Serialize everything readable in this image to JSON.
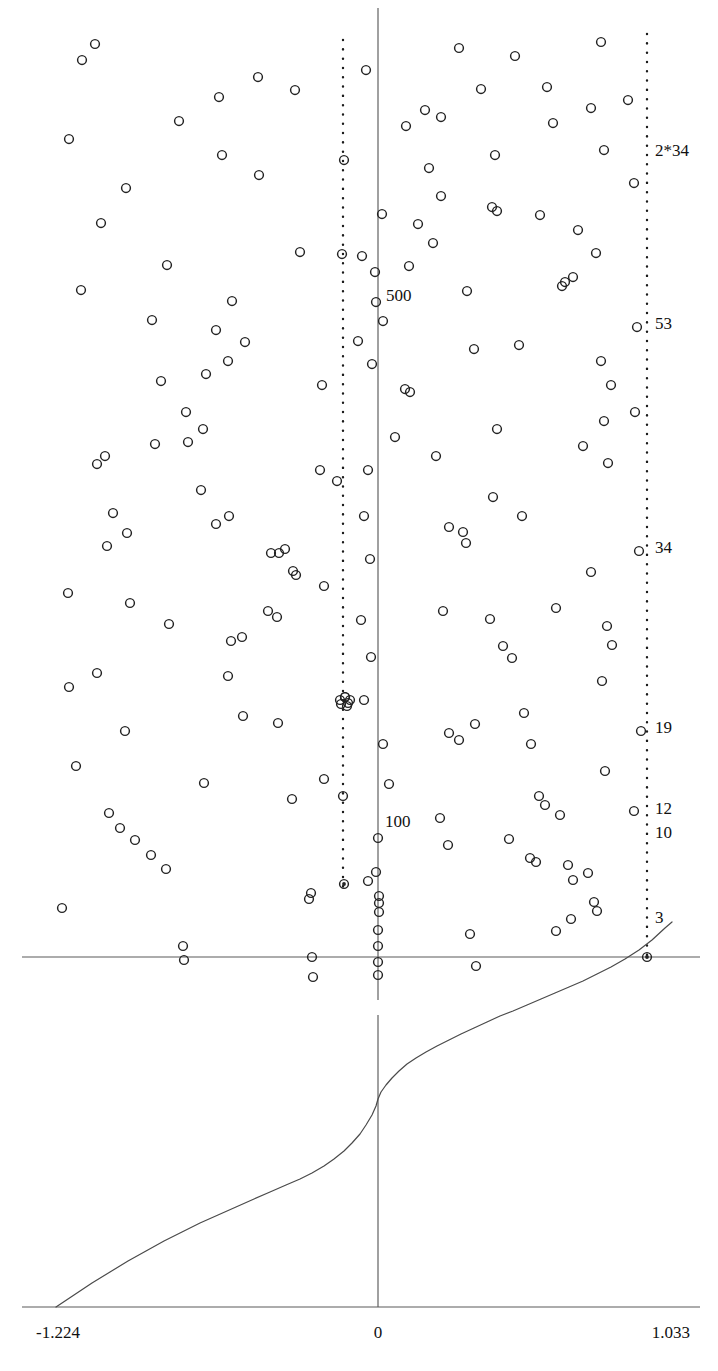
{
  "figure": {
    "title": "",
    "background": "#ffffff",
    "width": 718,
    "height": 1371
  },
  "colors": {
    "point_stroke": "#232323",
    "axis": "#5a5a5a",
    "reference_line": "#1b1b1b",
    "curve": "#4a4a4a",
    "text": "#111111"
  },
  "chart_data": {
    "type": "scatter",
    "title": "",
    "xlabel": "",
    "ylabel": "",
    "xlim": [
      -1.224,
      1.033
    ],
    "ylim": [
      0,
      1
    ],
    "grid": false,
    "legend": null,
    "panels": [
      {
        "name": "scatter-panel",
        "type": "scatter",
        "axis_x_zero_px": 378,
        "axis_y_baseline_px": 957,
        "marker": "open-circle",
        "marker_size_px": 11,
        "reference_lines": [
          {
            "name": "left-dotted-line",
            "x_px": 343,
            "style": "dotted"
          },
          {
            "name": "right-dotted-line",
            "x_px": 647,
            "style": "dotted"
          },
          {
            "name": "center-axis",
            "x_px": 378,
            "style": "solid"
          }
        ],
        "annotations": [
          {
            "text": "2*34",
            "x_px": 655,
            "y_px": 156,
            "anchor": "start"
          },
          {
            "text": "53",
            "x_px": 655,
            "y_px": 329,
            "anchor": "start"
          },
          {
            "text": "34",
            "x_px": 655,
            "y_px": 553,
            "anchor": "start"
          },
          {
            "text": "19",
            "x_px": 655,
            "y_px": 733,
            "anchor": "start"
          },
          {
            "text": "12",
            "x_px": 655,
            "y_px": 814,
            "anchor": "start"
          },
          {
            "text": "10",
            "x_px": 655,
            "y_px": 838,
            "anchor": "start"
          },
          {
            "text": "3",
            "x_px": 655,
            "y_px": 923,
            "anchor": "start"
          },
          {
            "text": "500",
            "x_px": 386,
            "y_px": 301,
            "anchor": "start"
          },
          {
            "text": "100",
            "x_px": 385,
            "y_px": 827,
            "anchor": "start"
          }
        ],
        "points_px": [
          [
            95,
            44
          ],
          [
            82,
            60
          ],
          [
            258,
            77
          ],
          [
            295,
            90
          ],
          [
            219,
            97
          ],
          [
            179,
            121
          ],
          [
            69,
            139
          ],
          [
            222,
            155
          ],
          [
            101,
            223
          ],
          [
            259,
            175
          ],
          [
            126,
            188
          ],
          [
            152,
            320
          ],
          [
            167,
            265
          ],
          [
            81,
            290
          ],
          [
            232,
            301
          ],
          [
            216,
            330
          ],
          [
            245,
            342
          ],
          [
            300,
            252
          ],
          [
            228,
            361
          ],
          [
            206,
            374
          ],
          [
            161,
            381
          ],
          [
            186,
            412
          ],
          [
            203,
            429
          ],
          [
            105,
            456
          ],
          [
            97,
            464
          ],
          [
            201,
            490
          ],
          [
            113,
            513
          ],
          [
            127,
            533
          ],
          [
            216,
            524
          ],
          [
            107,
            546
          ],
          [
            271,
            553
          ],
          [
            285,
            549
          ],
          [
            293,
            571
          ],
          [
            68,
            593
          ],
          [
            130,
            603
          ],
          [
            169,
            624
          ],
          [
            231,
            641
          ],
          [
            242,
            637
          ],
          [
            228,
            676
          ],
          [
            97,
            673
          ],
          [
            69,
            687
          ],
          [
            125,
            731
          ],
          [
            243,
            716
          ],
          [
            278,
            723
          ],
          [
            76,
            766
          ],
          [
            204,
            783
          ],
          [
            292,
            799
          ],
          [
            120,
            828
          ],
          [
            135,
            840
          ],
          [
            151,
            855
          ],
          [
            166,
            869
          ],
          [
            109,
            813
          ],
          [
            62,
            908
          ],
          [
            183,
            946
          ],
          [
            184,
            960
          ],
          [
            311,
            893
          ],
          [
            313,
            977
          ],
          [
            344,
            160
          ],
          [
            342,
            254
          ],
          [
            322,
            385
          ],
          [
            320,
            470
          ],
          [
            337,
            481
          ],
          [
            324,
            586
          ],
          [
            340,
            700
          ],
          [
            345,
            697
          ],
          [
            348,
            703
          ],
          [
            324,
            779
          ],
          [
            343,
            796
          ],
          [
            344,
            884
          ],
          [
            366,
            70
          ],
          [
            382,
            214
          ],
          [
            362,
            256
          ],
          [
            375,
            272
          ],
          [
            376,
            302
          ],
          [
            383,
            321
          ],
          [
            358,
            341
          ],
          [
            372,
            364
          ],
          [
            405,
            389
          ],
          [
            410,
            392
          ],
          [
            395,
            437
          ],
          [
            368,
            470
          ],
          [
            364,
            516
          ],
          [
            370,
            559
          ],
          [
            361,
            620
          ],
          [
            371,
            657
          ],
          [
            364,
            700
          ],
          [
            383,
            744
          ],
          [
            389,
            784
          ],
          [
            378,
            838
          ],
          [
            376,
            872
          ],
          [
            368,
            881
          ],
          [
            379,
            896
          ],
          [
            379,
            903
          ],
          [
            379,
            912
          ],
          [
            378,
            930
          ],
          [
            378,
            946
          ],
          [
            378,
            962
          ],
          [
            378,
            975
          ],
          [
            459,
            48
          ],
          [
            515,
            56
          ],
          [
            425,
            110
          ],
          [
            441,
            117
          ],
          [
            406,
            126
          ],
          [
            429,
            168
          ],
          [
            441,
            196
          ],
          [
            418,
            224
          ],
          [
            433,
            243
          ],
          [
            409,
            266
          ],
          [
            481,
            89
          ],
          [
            495,
            155
          ],
          [
            492,
            207
          ],
          [
            497,
            211
          ],
          [
            467,
            291
          ],
          [
            474,
            349
          ],
          [
            436,
            456
          ],
          [
            449,
            527
          ],
          [
            463,
            532
          ],
          [
            466,
            543
          ],
          [
            497,
            429
          ],
          [
            493,
            497
          ],
          [
            519,
            345
          ],
          [
            522,
            516
          ],
          [
            540,
            215
          ],
          [
            547,
            87
          ],
          [
            553,
            123
          ],
          [
            565,
            282
          ],
          [
            562,
            286
          ],
          [
            573,
            277
          ],
          [
            578,
            230
          ],
          [
            601,
            42
          ],
          [
            604,
            150
          ],
          [
            591,
            108
          ],
          [
            596,
            253
          ],
          [
            601,
            361
          ],
          [
            611,
            385
          ],
          [
            608,
            463
          ],
          [
            604,
            421
          ],
          [
            583,
            446
          ],
          [
            607,
            626
          ],
          [
            612,
            645
          ],
          [
            591,
            572
          ],
          [
            556,
            608
          ],
          [
            524,
            713
          ],
          [
            531,
            744
          ],
          [
            539,
            796
          ],
          [
            545,
            805
          ],
          [
            560,
            815
          ],
          [
            568,
            865
          ],
          [
            573,
            880
          ],
          [
            588,
            873
          ],
          [
            594,
            902
          ],
          [
            597,
            911
          ],
          [
            605,
            771
          ],
          [
            602,
            681
          ],
          [
            443,
            611
          ],
          [
            449,
            733
          ],
          [
            459,
            740
          ],
          [
            475,
            724
          ],
          [
            490,
            619
          ],
          [
            503,
            646
          ],
          [
            512,
            658
          ],
          [
            440,
            818
          ],
          [
            448,
            845
          ],
          [
            470,
            934
          ],
          [
            476,
            966
          ],
          [
            509,
            839
          ],
          [
            530,
            858
          ],
          [
            536,
            862
          ],
          [
            556,
            931
          ],
          [
            571,
            919
          ],
          [
            628,
            100
          ],
          [
            634,
            183
          ],
          [
            637,
            327
          ],
          [
            635,
            412
          ],
          [
            639,
            551
          ],
          [
            641,
            731
          ],
          [
            634,
            811
          ],
          [
            647,
            957
          ],
          [
            309,
            899
          ],
          [
            312,
            957
          ],
          [
            268,
            611
          ],
          [
            277,
            617
          ],
          [
            296,
            575
          ],
          [
            279,
            553
          ],
          [
            229,
            516
          ],
          [
            188,
            442
          ],
          [
            155,
            444
          ]
        ],
        "cluster_points_px": [
          [
            345,
            697
          ],
          [
            350,
            700
          ],
          [
            341,
            704
          ],
          [
            347,
            706
          ]
        ]
      },
      {
        "name": "curve-panel",
        "type": "line",
        "axis_x_zero_px": 378,
        "axis_y_baseline_px": 1307,
        "description": "monotone increasing quantile curve crossing x=0",
        "x_tick_labels": [
          "-1.224",
          "0",
          "1.033"
        ],
        "x_tick_px": [
          60,
          378,
          665
        ],
        "curve_px": [
          [
            56,
            1307
          ],
          [
            74,
            1295
          ],
          [
            92,
            1283
          ],
          [
            110,
            1272
          ],
          [
            128,
            1261
          ],
          [
            146,
            1251
          ],
          [
            164,
            1241
          ],
          [
            182,
            1232
          ],
          [
            200,
            1223
          ],
          [
            218,
            1215
          ],
          [
            236,
            1207
          ],
          [
            254,
            1199
          ],
          [
            270,
            1192
          ],
          [
            286,
            1185
          ],
          [
            300,
            1179
          ],
          [
            312,
            1173
          ],
          [
            324,
            1166
          ],
          [
            334,
            1159
          ],
          [
            344,
            1151
          ],
          [
            352,
            1143
          ],
          [
            360,
            1134
          ],
          [
            366,
            1125
          ],
          [
            372,
            1115
          ],
          [
            376,
            1106
          ],
          [
            378,
            1099
          ],
          [
            381,
            1092
          ],
          [
            386,
            1085
          ],
          [
            392,
            1078
          ],
          [
            399,
            1071
          ],
          [
            407,
            1064
          ],
          [
            416,
            1058
          ],
          [
            426,
            1052
          ],
          [
            437,
            1046
          ],
          [
            449,
            1040
          ],
          [
            461,
            1034
          ],
          [
            474,
            1028
          ],
          [
            487,
            1022
          ],
          [
            500,
            1016
          ],
          [
            513,
            1011
          ],
          [
            527,
            1005
          ],
          [
            541,
            999
          ],
          [
            555,
            993
          ],
          [
            569,
            987
          ],
          [
            583,
            981
          ],
          [
            597,
            974
          ],
          [
            611,
            967
          ],
          [
            625,
            959
          ],
          [
            639,
            950
          ],
          [
            652,
            940
          ],
          [
            665,
            928
          ],
          [
            672,
            922
          ]
        ]
      }
    ]
  },
  "axis_labels": {
    "left": "-1.224",
    "center": "0",
    "right": "1.033"
  },
  "scatter_labels": {
    "l1": "2*34",
    "l2": "53",
    "l3": "34",
    "l4": "19",
    "l5": "12",
    "l6": "10",
    "l7": "3",
    "l8": "500",
    "l9": "100"
  }
}
